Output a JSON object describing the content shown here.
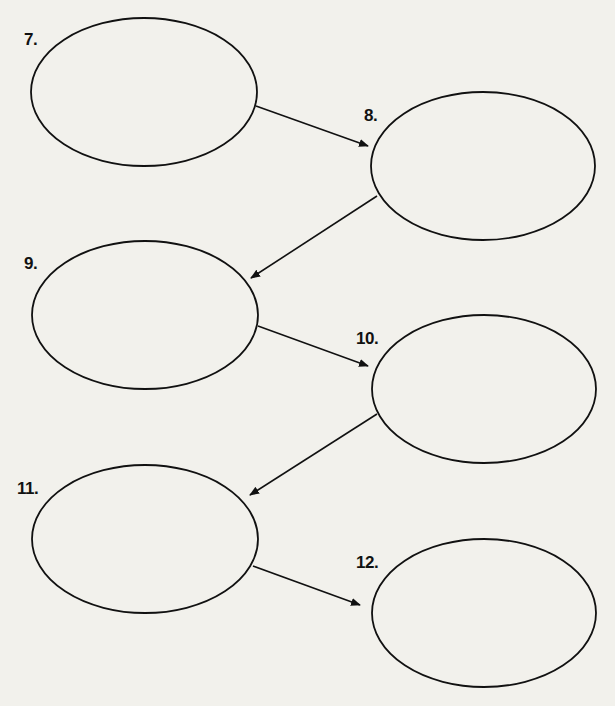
{
  "diagram": {
    "type": "sequence-chain",
    "background_color": "#f2f1ec",
    "stroke_color": "#111111",
    "nodes": [
      {
        "id": "7",
        "label": "7.",
        "cx": 144,
        "cy": 92,
        "rx": 113,
        "ry": 74,
        "label_x": 24,
        "label_y": 31,
        "content": ""
      },
      {
        "id": "8",
        "label": "8.",
        "cx": 483,
        "cy": 166,
        "rx": 112,
        "ry": 74,
        "label_x": 364,
        "label_y": 107,
        "content": ""
      },
      {
        "id": "9",
        "label": "9.",
        "cx": 145,
        "cy": 315,
        "rx": 113,
        "ry": 74,
        "label_x": 24,
        "label_y": 255,
        "content": ""
      },
      {
        "id": "10",
        "label": "10.",
        "cx": 484,
        "cy": 389,
        "rx": 112,
        "ry": 74,
        "label_x": 356,
        "label_y": 330,
        "content": ""
      },
      {
        "id": "11",
        "label": "11.",
        "cx": 145,
        "cy": 539,
        "rx": 113,
        "ry": 74,
        "label_x": 17,
        "label_y": 480,
        "content": ""
      },
      {
        "id": "12",
        "label": "12.",
        "cx": 484,
        "cy": 613,
        "rx": 112,
        "ry": 74,
        "label_x": 356,
        "label_y": 554,
        "content": ""
      }
    ],
    "edges": [
      {
        "from": "7",
        "to": "8",
        "x1": 256,
        "y1": 106,
        "x2": 368,
        "y2": 146
      },
      {
        "from": "8",
        "to": "9",
        "x1": 377,
        "y1": 196,
        "x2": 251,
        "y2": 278
      },
      {
        "from": "9",
        "to": "10",
        "x1": 258,
        "y1": 326,
        "x2": 368,
        "y2": 366
      },
      {
        "from": "10",
        "to": "11",
        "x1": 377,
        "y1": 414,
        "x2": 250,
        "y2": 495
      },
      {
        "from": "11",
        "to": "12",
        "x1": 253,
        "y1": 566,
        "x2": 360,
        "y2": 605
      }
    ]
  }
}
